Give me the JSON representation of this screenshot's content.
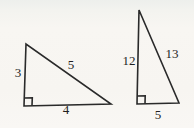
{
  "figure": {
    "background": "#f7f5f1",
    "stroke_color": "#2a2a2a",
    "stroke_width": "1.6",
    "text_color": "#1f1f1f",
    "triangles": [
      {
        "name": "3-4-5 right triangle",
        "points": "26,44 24,106 111,104",
        "right_angle_marker": "24.3,98 32.3,97.8 32,105.8",
        "labels": {
          "left_leg": {
            "text": "3",
            "x": "18",
            "y": "77"
          },
          "hypotenuse": {
            "text": "5",
            "x": "71",
            "y": "69"
          },
          "bottom_leg": {
            "text": "4",
            "x": "66",
            "y": "114"
          }
        }
      },
      {
        "name": "5-12-13 right triangle",
        "points": "139,10 137,104 179,103",
        "right_angle_marker": "137.2,96 145.2,95.8 145,103.8",
        "labels": {
          "left_leg": {
            "text": "12",
            "x": "129",
            "y": "65"
          },
          "hypotenuse": {
            "text": "13",
            "x": "172",
            "y": "58"
          },
          "bottom_leg": {
            "text": "5",
            "x": "158",
            "y": "119"
          }
        }
      }
    ]
  }
}
